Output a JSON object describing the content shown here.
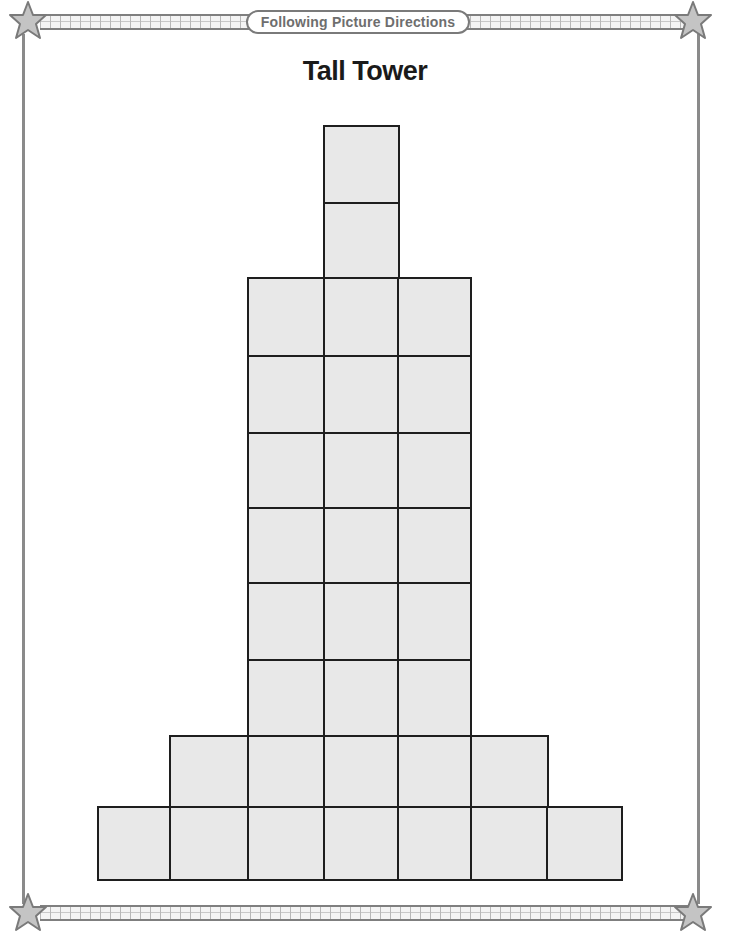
{
  "header": {
    "banner_label": "Following Picture Directions",
    "title": "Tall Tower"
  },
  "decorations": {
    "corner_icons": [
      "star-icon",
      "star-icon",
      "star-icon",
      "star-icon"
    ],
    "border_color": "#8a8a8a",
    "star_fill": "#c4c4c4"
  },
  "figure": {
    "name": "tall-tower",
    "cell_fill": "#e8e8e8",
    "outline_color": "#1e1e1e",
    "rows_top_to_bottom": [
      {
        "row": 1,
        "cells": 1
      },
      {
        "row": 2,
        "cells": 1
      },
      {
        "row": 3,
        "cells": 3
      },
      {
        "row": 4,
        "cells": 3
      },
      {
        "row": 5,
        "cells": 3
      },
      {
        "row": 6,
        "cells": 3
      },
      {
        "row": 7,
        "cells": 3
      },
      {
        "row": 8,
        "cells": 3
      },
      {
        "row": 9,
        "cells": 5
      },
      {
        "row": 10,
        "cells": 7
      }
    ],
    "total_cells": 32
  }
}
